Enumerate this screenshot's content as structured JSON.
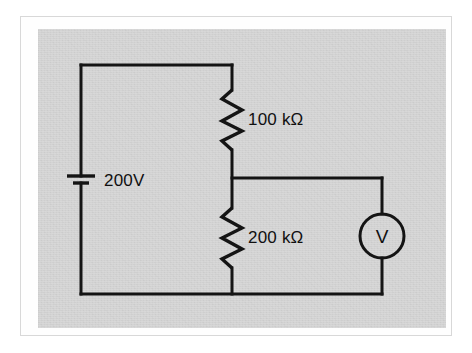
{
  "figure": {
    "plate_color": "#d3d3d3",
    "ink_color": "#141414",
    "page_color": "#ffffff"
  },
  "components": {
    "source": {
      "type": "battery",
      "label": "200V",
      "label_x": 104,
      "label_y": 186
    },
    "resistor_top": {
      "type": "resistor",
      "label": "100 kΩ",
      "label_x": 248,
      "label_y": 125
    },
    "resistor_bottom": {
      "type": "resistor",
      "label": "200 kΩ",
      "label_x": 248,
      "label_y": 243
    },
    "meter": {
      "type": "voltmeter",
      "glyph": "V",
      "glyph_x": 382,
      "glyph_y": 243,
      "center_x": 382,
      "center_y": 236,
      "radius": 22
    }
  },
  "geometry": {
    "left_rail_x": 81,
    "mid_rail_x": 232,
    "right_rail_x": 382,
    "top_rail_y": 65,
    "mid_rail_y": 178,
    "bottom_rail_y": 294
  },
  "wires": {
    "top_left_corner": "M 81 65 L 232 65",
    "left_rail_upper": "M 81 65 L 81 176",
    "left_rail_lower": "M 81 183 L 81 294",
    "bottom_rail": "M 81 294 L 382 294",
    "mid_rail_to_meter": "M 232 178 L 382 178",
    "mid_rail_top_lead": "M 232 65 L 232 90",
    "mid_rail_join_lead": "M 232 150 L 232 208",
    "mid_rail_bottom_lead": "M 232 268 L 232 294",
    "meter_upper_lead": "M 382 178 L 382 214",
    "meter_lower_lead": "M 382 258 L 382 294"
  },
  "symbols": {
    "battery": {
      "long_plate": {
        "x1": 67,
        "x2": 95,
        "y": 176
      },
      "short_plate": {
        "x1": 73,
        "x2": 89,
        "y": 183
      }
    },
    "resistor_top_path": "M 232 90 L 222 99 L 242 110 L 222 121 L 242 131 L 222 141 L 232 150",
    "resistor_bottom_path": "M 232 208 L 222 217 L 242 228 L 222 238 L 242 249 L 222 259 L 232 268"
  }
}
